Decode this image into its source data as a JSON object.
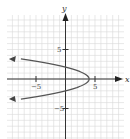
{
  "chart_data": {
    "type": "line",
    "title": "",
    "xlabel": "x",
    "ylabel": "y",
    "xlim": [
      -10,
      10
    ],
    "ylim": [
      -10,
      11
    ],
    "grid": true,
    "grid_step": 1,
    "x_ticks": [
      {
        "value": -5,
        "label": "−5"
      },
      {
        "value": 5,
        "label": "5"
      }
    ],
    "y_ticks": [
      {
        "value": 5,
        "label": "5"
      },
      {
        "value": -5,
        "label": "−5"
      }
    ],
    "series": [
      {
        "name": "x = 4 - y^2",
        "equation": "x = 4 - y^2",
        "vertex": [
          4,
          0
        ],
        "opens": "left",
        "y_intercepts": [
          2,
          -2
        ],
        "arrow_ends": true,
        "points": [
          [
            -9.4,
            3.4
          ],
          [
            -5,
            3.0
          ],
          [
            -2.25,
            2.5
          ],
          [
            0,
            2
          ],
          [
            1.75,
            1.5
          ],
          [
            3,
            1
          ],
          [
            3.75,
            0.5
          ],
          [
            4,
            0
          ],
          [
            3.75,
            -0.5
          ],
          [
            3,
            -1
          ],
          [
            1.75,
            -1.5
          ],
          [
            0,
            -2
          ],
          [
            -2.25,
            -2.5
          ],
          [
            -5,
            -3.0
          ],
          [
            -9.4,
            -3.4
          ]
        ]
      }
    ],
    "colors": {
      "curve": "#555555",
      "axes": "#333333",
      "grid": "#d8d8d8"
    }
  },
  "labels": {
    "x_axis": "x",
    "y_axis": "y",
    "x_tick_neg5": "−5",
    "x_tick_5": "5",
    "y_tick_5": "5",
    "y_tick_neg5": "−5"
  }
}
